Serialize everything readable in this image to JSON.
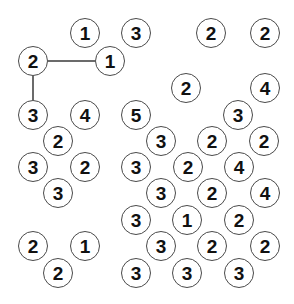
{
  "canvas": {
    "width": 294,
    "height": 304,
    "background": "#ffffff",
    "node_radius": 15,
    "node_stroke": "#4a4a4a",
    "node_fill": "#ffffff",
    "label_color": "#111111",
    "edge_color": "#6b6b6b",
    "edge_width": 2
  },
  "nodes": [
    {
      "id": "n1",
      "label": "1",
      "x": 85,
      "y": 33
    },
    {
      "id": "n2",
      "label": "3",
      "x": 136,
      "y": 33
    },
    {
      "id": "n3",
      "label": "2",
      "x": 211,
      "y": 33
    },
    {
      "id": "n4",
      "label": "2",
      "x": 265,
      "y": 33
    },
    {
      "id": "n5",
      "label": "2",
      "x": 33,
      "y": 61
    },
    {
      "id": "n6",
      "label": "1",
      "x": 110,
      "y": 61
    },
    {
      "id": "n7",
      "label": "2",
      "x": 186,
      "y": 88
    },
    {
      "id": "n8",
      "label": "4",
      "x": 265,
      "y": 88
    },
    {
      "id": "n9",
      "label": "3",
      "x": 33,
      "y": 115
    },
    {
      "id": "n10",
      "label": "4",
      "x": 85,
      "y": 115
    },
    {
      "id": "n11",
      "label": "5",
      "x": 136,
      "y": 115
    },
    {
      "id": "n12",
      "label": "3",
      "x": 238,
      "y": 115
    },
    {
      "id": "n13",
      "label": "2",
      "x": 58,
      "y": 141
    },
    {
      "id": "n14",
      "label": "3",
      "x": 161,
      "y": 141
    },
    {
      "id": "n15",
      "label": "2",
      "x": 212,
      "y": 141
    },
    {
      "id": "n16",
      "label": "2",
      "x": 264,
      "y": 141
    },
    {
      "id": "n17",
      "label": "3",
      "x": 33,
      "y": 167
    },
    {
      "id": "n18",
      "label": "2",
      "x": 85,
      "y": 167
    },
    {
      "id": "n19",
      "label": "3",
      "x": 136,
      "y": 167
    },
    {
      "id": "n20",
      "label": "2",
      "x": 188,
      "y": 167
    },
    {
      "id": "n21",
      "label": "4",
      "x": 239,
      "y": 167
    },
    {
      "id": "n22",
      "label": "3",
      "x": 58,
      "y": 193
    },
    {
      "id": "n23",
      "label": "3",
      "x": 161,
      "y": 193
    },
    {
      "id": "n24",
      "label": "2",
      "x": 212,
      "y": 193
    },
    {
      "id": "n25",
      "label": "4",
      "x": 265,
      "y": 193
    },
    {
      "id": "n26",
      "label": "3",
      "x": 136,
      "y": 220
    },
    {
      "id": "n27",
      "label": "1",
      "x": 187,
      "y": 220
    },
    {
      "id": "n28",
      "label": "2",
      "x": 239,
      "y": 220
    },
    {
      "id": "n29",
      "label": "2",
      "x": 33,
      "y": 246
    },
    {
      "id": "n30",
      "label": "1",
      "x": 85,
      "y": 246
    },
    {
      "id": "n31",
      "label": "3",
      "x": 161,
      "y": 246
    },
    {
      "id": "n32",
      "label": "2",
      "x": 212,
      "y": 246
    },
    {
      "id": "n33",
      "label": "2",
      "x": 265,
      "y": 246
    },
    {
      "id": "n34",
      "label": "2",
      "x": 58,
      "y": 273
    },
    {
      "id": "n35",
      "label": "3",
      "x": 136,
      "y": 273
    },
    {
      "id": "n36",
      "label": "3",
      "x": 187,
      "y": 273
    },
    {
      "id": "n37",
      "label": "3",
      "x": 239,
      "y": 273
    }
  ],
  "edges": [
    {
      "id": "e1",
      "from": "n5",
      "to": "n6",
      "x1": 48,
      "y1": 61,
      "x2": 95,
      "y2": 61
    },
    {
      "id": "e2",
      "from": "n5",
      "to": "n9",
      "x1": 33,
      "y1": 76,
      "x2": 33,
      "y2": 100
    }
  ]
}
